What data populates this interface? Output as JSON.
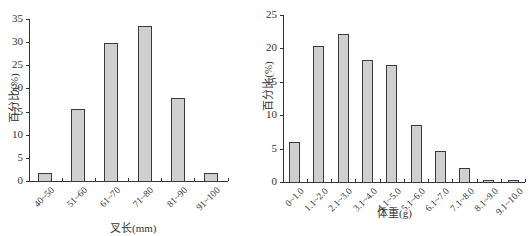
{
  "chart_data": [
    {
      "type": "bar",
      "title": "",
      "xlabel": "叉长(mm)",
      "ylabel": "百分比(%)",
      "ylim": [
        0,
        35
      ],
      "yticks": [
        0,
        5,
        10,
        15,
        20,
        25,
        30,
        35
      ],
      "grid": false,
      "categories": [
        "40~50",
        "51~60",
        "61~70",
        "71~80",
        "81~90",
        "91~100"
      ],
      "values": [
        1.7,
        15.5,
        29.8,
        33.5,
        17.9,
        1.7
      ]
    },
    {
      "type": "bar",
      "title": "",
      "xlabel": "体重(g)",
      "ylabel": "百分比(%)",
      "ylim": [
        0,
        25
      ],
      "yticks": [
        0,
        5,
        10,
        15,
        20,
        25
      ],
      "grid": false,
      "categories": [
        "0~1.0",
        "1.1~2.0",
        "2.1~3.0",
        "3.1~4.0",
        "4.1~5.0",
        "5.1~6.0",
        "6.1~7.0",
        "7.1~8.0",
        "8.1~9.0",
        "9.1~10.0"
      ],
      "values": [
        6.0,
        20.3,
        22.1,
        18.3,
        17.5,
        8.5,
        4.6,
        2.1,
        0.3,
        0.3
      ]
    }
  ],
  "style": {
    "bar_fill": "#cfcfcf",
    "bar_edge": "#3a3a3a",
    "axis_color": "#333333"
  }
}
